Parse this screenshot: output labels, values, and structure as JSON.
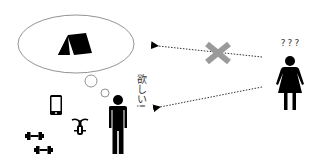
{
  "diagram": {
    "thought": {
      "icon": "tent-icon",
      "bubble_shape": "ellipse"
    },
    "owned_items": [
      {
        "name": "smartphone",
        "icon": "smartphone-icon"
      },
      {
        "name": "bicycle",
        "icon": "bicycle-icon"
      },
      {
        "name": "dumbbell",
        "icon": "dumbbell-icon"
      },
      {
        "name": "dumbbell",
        "icon": "dumbbell-icon"
      }
    ],
    "man": {
      "icon": "man-icon",
      "speech": "欲しい!"
    },
    "woman": {
      "icon": "woman-icon",
      "speech": "???"
    },
    "arrows": [
      {
        "from": "woman",
        "to": "thought",
        "style": "dotted",
        "blocked": true,
        "block_icon": "cross-icon"
      },
      {
        "from": "woman",
        "to": "man",
        "style": "dotted",
        "blocked": false
      }
    ],
    "colors": {
      "ink": "#000000",
      "outline": "#777777",
      "cross": "#9a9a9a",
      "text": "#333333",
      "background": "#ffffff"
    }
  }
}
